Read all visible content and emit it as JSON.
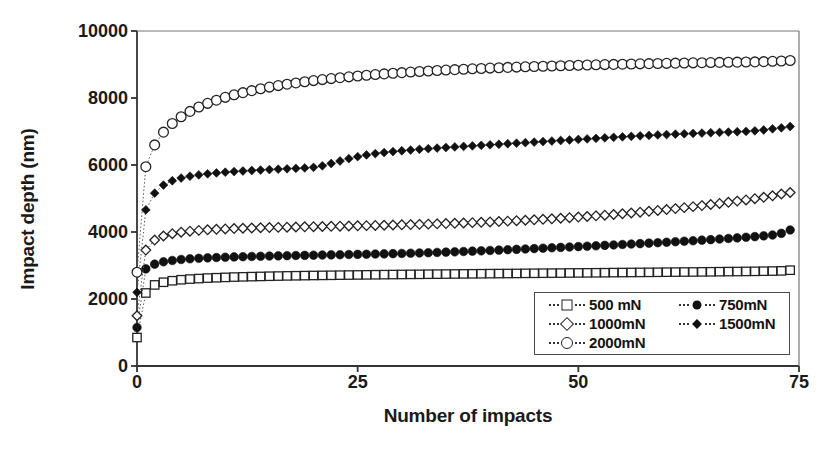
{
  "chart_data": {
    "type": "scatter",
    "title": "",
    "xlabel": "Number of impacts",
    "ylabel": "Impact depth (nm)",
    "xlim": [
      0,
      75
    ],
    "ylim": [
      0,
      10000
    ],
    "xticks": [
      0,
      25,
      50,
      75
    ],
    "yticks": [
      0,
      2000,
      4000,
      6000,
      8000,
      10000
    ],
    "grid": false,
    "legend_position": "lower right",
    "x": [
      0,
      1,
      2,
      3,
      4,
      5,
      6,
      7,
      8,
      9,
      10,
      11,
      12,
      13,
      14,
      15,
      16,
      17,
      18,
      19,
      20,
      21,
      22,
      23,
      24,
      25,
      26,
      27,
      28,
      29,
      30,
      31,
      32,
      33,
      34,
      35,
      36,
      37,
      38,
      39,
      40,
      41,
      42,
      43,
      44,
      45,
      46,
      47,
      48,
      49,
      50,
      51,
      52,
      53,
      54,
      55,
      56,
      57,
      58,
      59,
      60,
      61,
      62,
      63,
      64,
      65,
      66,
      67,
      68,
      69,
      70,
      71,
      72,
      73,
      74
    ],
    "series": [
      {
        "name": "500 mN",
        "marker": "square-open",
        "values": [
          850,
          2180,
          2420,
          2500,
          2545,
          2575,
          2595,
          2610,
          2625,
          2635,
          2645,
          2655,
          2662,
          2668,
          2674,
          2680,
          2685,
          2690,
          2694,
          2698,
          2702,
          2705,
          2708,
          2712,
          2715,
          2718,
          2721,
          2724,
          2727,
          2730,
          2732,
          2735,
          2737,
          2740,
          2742,
          2745,
          2747,
          2750,
          2752,
          2754,
          2757,
          2759,
          2761,
          2763,
          2766,
          2768,
          2770,
          2772,
          2774,
          2777,
          2779,
          2781,
          2783,
          2785,
          2788,
          2790,
          2792,
          2794,
          2796,
          2798,
          2801,
          2803,
          2805,
          2807,
          2810,
          2812,
          2815,
          2818,
          2820,
          2823,
          2826,
          2830,
          2834,
          2840,
          2860
        ]
      },
      {
        "name": "750mN",
        "marker": "circle-filled",
        "values": [
          1150,
          2900,
          3040,
          3110,
          3150,
          3180,
          3200,
          3215,
          3228,
          3238,
          3248,
          3256,
          3263,
          3270,
          3276,
          3282,
          3288,
          3293,
          3298,
          3303,
          3308,
          3313,
          3318,
          3322,
          3327,
          3332,
          3337,
          3342,
          3348,
          3354,
          3360,
          3367,
          3374,
          3382,
          3390,
          3399,
          3408,
          3418,
          3428,
          3438,
          3449,
          3460,
          3471,
          3482,
          3493,
          3505,
          3516,
          3528,
          3540,
          3552,
          3564,
          3576,
          3588,
          3601,
          3614,
          3627,
          3640,
          3653,
          3667,
          3681,
          3695,
          3710,
          3725,
          3740,
          3756,
          3772,
          3789,
          3806,
          3824,
          3843,
          3863,
          3885,
          3910,
          3960,
          4060
        ]
      },
      {
        "name": "1000mN",
        "marker": "diamond-open",
        "values": [
          1500,
          3460,
          3760,
          3880,
          3950,
          3995,
          4025,
          4048,
          4066,
          4080,
          4092,
          4102,
          4111,
          4119,
          4126,
          4132,
          4138,
          4144,
          4149,
          4154,
          4159,
          4164,
          4169,
          4174,
          4179,
          4185,
          4190,
          4196,
          4202,
          4208,
          4214,
          4221,
          4228,
          4235,
          4243,
          4251,
          4260,
          4269,
          4279,
          4289,
          4300,
          4312,
          4324,
          4337,
          4350,
          4364,
          4379,
          4394,
          4410,
          4427,
          4445,
          4463,
          4482,
          4502,
          4523,
          4545,
          4568,
          4592,
          4617,
          4643,
          4670,
          4698,
          4727,
          4757,
          4788,
          4820,
          4853,
          4887,
          4922,
          4958,
          4995,
          5035,
          5080,
          5135,
          5180
        ]
      },
      {
        "name": "1500mN",
        "marker": "diamond-filled",
        "values": [
          2200,
          4660,
          5160,
          5400,
          5530,
          5610,
          5665,
          5705,
          5737,
          5763,
          5785,
          5804,
          5821,
          5836,
          5850,
          5863,
          5875,
          5887,
          5899,
          5912,
          5930,
          5975,
          6045,
          6120,
          6190,
          6250,
          6300,
          6340,
          6372,
          6400,
          6425,
          6447,
          6468,
          6487,
          6505,
          6522,
          6539,
          6555,
          6571,
          6587,
          6603,
          6619,
          6635,
          6651,
          6667,
          6683,
          6699,
          6715,
          6731,
          6747,
          6763,
          6779,
          6795,
          6811,
          6826,
          6841,
          6856,
          6870,
          6884,
          6897,
          6909,
          6921,
          6932,
          6943,
          6953,
          6963,
          6973,
          6983,
          6993,
          7003,
          7020,
          7045,
          7080,
          7110,
          7150
        ]
      },
      {
        "name": "2000mN",
        "marker": "circle-open",
        "values": [
          2800,
          5950,
          6600,
          6980,
          7240,
          7440,
          7600,
          7730,
          7840,
          7935,
          8020,
          8095,
          8160,
          8220,
          8275,
          8325,
          8370,
          8412,
          8450,
          8486,
          8519,
          8550,
          8579,
          8606,
          8632,
          8656,
          8679,
          8700,
          8720,
          8739,
          8757,
          8774,
          8790,
          8805,
          8820,
          8834,
          8847,
          8859,
          8871,
          8882,
          8893,
          8903,
          8913,
          8922,
          8931,
          8940,
          8948,
          8956,
          8964,
          8971,
          8978,
          8985,
          8991,
          8997,
          9003,
          9009,
          9015,
          9020,
          9025,
          9030,
          9035,
          9040,
          9045,
          9049,
          9054,
          9058,
          9062,
          9066,
          9070,
          9074,
          9078,
          9085,
          9095,
          9105,
          9120
        ]
      }
    ]
  },
  "legend": {
    "entries": [
      {
        "label": "500 mN",
        "marker": "square-open"
      },
      {
        "label": "750mN",
        "marker": "circle-filled"
      },
      {
        "label": "1000mN",
        "marker": "diamond-open"
      },
      {
        "label": "1500mN",
        "marker": "diamond-filled"
      },
      {
        "label": "2000mN",
        "marker": "circle-open"
      }
    ]
  },
  "colors": {
    "axis": "#333333",
    "marker_stroke": "#222222",
    "marker_fill": "#111111",
    "background": "#ffffff",
    "text": "#1a1a1a"
  }
}
